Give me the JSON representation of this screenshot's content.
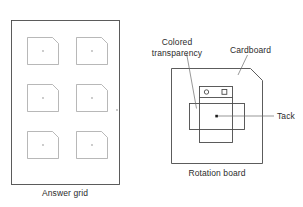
{
  "figure": {
    "type": "instructional-diagram",
    "background_color": "#ffffff"
  },
  "answer_grid": {
    "caption": "Answer grid",
    "panel_outline_color": "#4a4a4a",
    "cell_outline_color": "#9a9a9a",
    "columns": 2,
    "rows": 3,
    "cell_count": 6,
    "cell_shape": "square-with-clipped-top-right-corner",
    "cell_center_marker": "dot",
    "cells": [
      {
        "id": "cell-r1c1",
        "row": 1,
        "col": 1
      },
      {
        "id": "cell-r1c2",
        "row": 1,
        "col": 2
      },
      {
        "id": "cell-r2c1",
        "row": 2,
        "col": 1
      },
      {
        "id": "cell-r2c2",
        "row": 2,
        "col": 2
      },
      {
        "id": "cell-r3c1",
        "row": 3,
        "col": 1
      },
      {
        "id": "cell-r3c2",
        "row": 3,
        "col": 2
      }
    ]
  },
  "rotation_board": {
    "caption": "Rotation board",
    "board_outline_color": "#4a4a4a",
    "board_shape": "square-with-clipped-top-right-corner",
    "parts": {
      "cardboard": {
        "label": "Cardboard",
        "shape": "vertical-rectangle",
        "markers": [
          {
            "name": "circle-marker",
            "shape": "circle"
          },
          {
            "name": "square-marker",
            "shape": "square"
          }
        ]
      },
      "colored_transparency": {
        "label": "Colored transparency",
        "label_line_1": "Colored",
        "label_line_2": "transparency",
        "shape": "horizontal-rectangle"
      },
      "tack": {
        "label": "Tack",
        "shape": "dot",
        "color": "#1a1a1a"
      }
    }
  }
}
